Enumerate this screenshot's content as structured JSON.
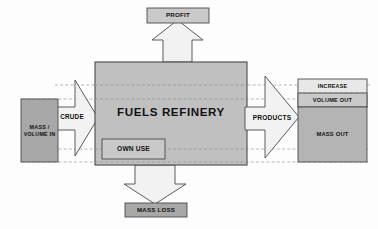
{
  "diagram": {
    "colors": {
      "box_fill_mid": "#a8a8a8",
      "box_fill_light": "#c9c9c9",
      "arrow_fill": "#f2f2f2",
      "stroke": "#4a4a4a",
      "dashed": "#9a9a9a",
      "text": "#111111",
      "background": "#fdfdfd"
    },
    "nodes": {
      "profit": {
        "label": "PROFIT",
        "fill": "#c9c9c9"
      },
      "mass_volume_in": {
        "label": "MASS /\nVOLUME IN",
        "fill": "#a8a8a8"
      },
      "refinery": {
        "label": "FUELS REFINERY",
        "fill": "#c0c0c0"
      },
      "own_use": {
        "label": "OWN USE",
        "fill": "#c9c9c9"
      },
      "increase": {
        "label": "INCREASE",
        "fill": "#e8e8e8"
      },
      "volume_out": {
        "label": "VOLUME OUT",
        "fill": "#c9c9c9"
      },
      "mass_out": {
        "label": "MASS OUT",
        "fill": "#b4b4b4"
      },
      "mass_loss": {
        "label": "MASS LOSS",
        "fill": "#a8a8a8"
      }
    },
    "arrows": {
      "crude": {
        "label": "CRUDE",
        "direction": "right"
      },
      "products": {
        "label": "PRODUCTS",
        "direction": "right"
      },
      "profit_up": {
        "label": "",
        "direction": "up"
      },
      "mass_loss_down": {
        "label": "",
        "direction": "down"
      }
    },
    "dashed_guides": [
      {
        "name": "guide-top",
        "y": 85
      },
      {
        "name": "guide-upper",
        "y": 99
      },
      {
        "name": "guide-lower",
        "y": 149
      },
      {
        "name": "guide-bottom",
        "y": 162
      }
    ]
  }
}
